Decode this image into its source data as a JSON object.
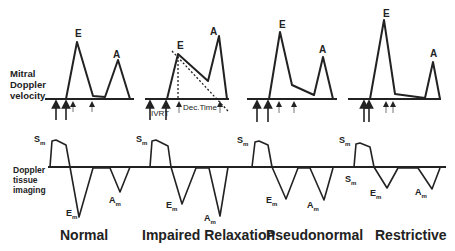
{
  "row_labels": {
    "mitral": [
      "Mitral",
      "Doppler",
      "velocity"
    ],
    "tissue": [
      "Doppler",
      "tissue",
      "imaging"
    ]
  },
  "panels": [
    {
      "title": "Normal",
      "mitral_peaks": [
        "E",
        "A"
      ],
      "tissue_peaks": [
        "Sm",
        "Em",
        "Am"
      ]
    },
    {
      "title": "Impaired Relaxation",
      "mitral_peaks": [
        "E",
        "A"
      ],
      "tissue_peaks": [
        "Sm",
        "Em",
        "Am"
      ],
      "annotations": [
        "IVRT",
        "Dec.Time"
      ]
    },
    {
      "title": "Pseudonormal",
      "mitral_peaks": [
        "E",
        "A"
      ],
      "tissue_peaks": [
        "Sm",
        "Em",
        "Am"
      ]
    },
    {
      "title": "Restrictive",
      "mitral_peaks": [
        "E",
        "A"
      ],
      "tissue_peaks": [
        "Sm",
        "Sm",
        "Em",
        "Am"
      ]
    }
  ],
  "labels": {
    "E": "E",
    "A": "A",
    "S": "S",
    "E_": "E",
    "A_": "A",
    "sub": "m",
    "ivrt": "IVRT",
    "dectime": "Dec.Time"
  }
}
